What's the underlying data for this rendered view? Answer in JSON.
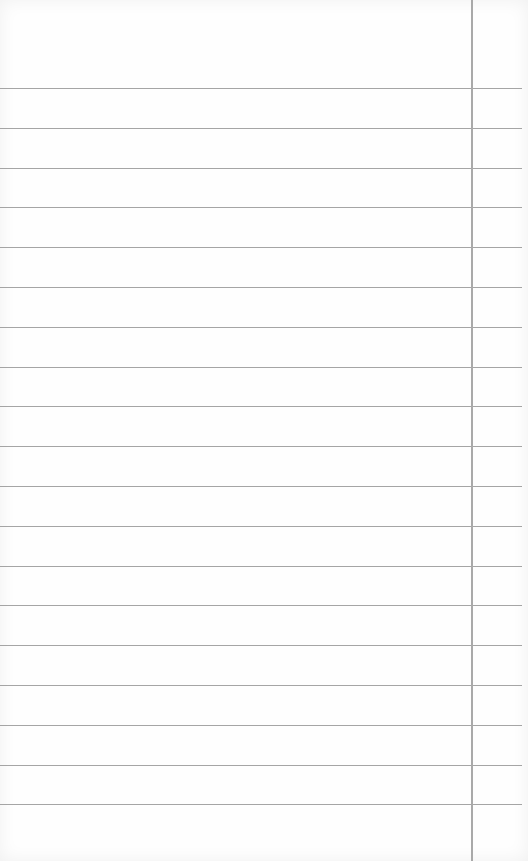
{
  "page": {
    "type": "lined-paper",
    "content": "",
    "rules": {
      "count": 19,
      "first_y": 88,
      "spacing": 39.8,
      "color": "#8f8f8f"
    },
    "margin_line": {
      "x": 471,
      "color": "#a9a9a9"
    },
    "background": "#fefefe"
  }
}
